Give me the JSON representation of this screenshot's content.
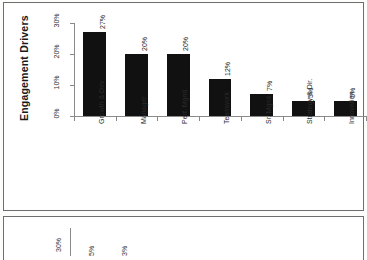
{
  "document": {
    "panel_main_name": "engagement-drivers-figure",
    "panel_next_name": "next-figure-partial"
  },
  "chart_data": {
    "type": "bar",
    "title": "Engagement Drivers",
    "xlabel": "",
    "ylabel": "",
    "ylim": [
      0,
      30
    ],
    "grid": false,
    "legend": "none",
    "orientation": "vertical-bars-on-rotated-page",
    "categories": [
      "Growth & Dev.",
      "Manager",
      "Perf. Mgmt.",
      "Teamwork",
      "Sr. Mgmt.",
      "Strategy & Dir.",
      "Innovation"
    ],
    "values": [
      27,
      20,
      20,
      12,
      7,
      5,
      5
    ],
    "value_labels": [
      "27%",
      "20%",
      "20%",
      "12%",
      "7%",
      "5%",
      "5%"
    ],
    "ytick_labels": [
      "0%",
      "10%",
      "20%",
      "30%"
    ],
    "ytick_values": [
      0,
      10,
      20,
      30
    ],
    "bar_color": "#111111",
    "axis_color": "#8a8a8a"
  },
  "secondary_chart": {
    "type": "bar",
    "ytick_labels": [
      "30%"
    ],
    "value_labels": [
      "5%",
      "3%"
    ],
    "note": "partially visible, cropped at page bottom"
  }
}
